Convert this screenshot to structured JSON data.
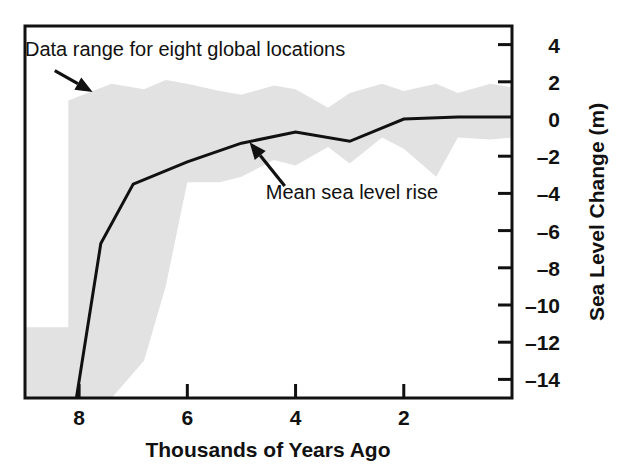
{
  "chart_data": {
    "type": "line",
    "title": "",
    "subtitle": "",
    "xlabel": "Thousands of Years Ago",
    "ylabel": "Sea Level Change (m)",
    "xlim": [
      9.0,
      0.0
    ],
    "ylim": [
      -15.0,
      5.0
    ],
    "x_inverted": true,
    "grid": false,
    "legend_position": "none",
    "xticks": [
      8,
      6,
      4,
      2
    ],
    "xtick_labels": [
      "8",
      "6",
      "4",
      "2"
    ],
    "yticks": [
      4,
      2,
      0,
      -2,
      -4,
      -6,
      -8,
      -10,
      -12,
      -14
    ],
    "ytick_labels": [
      "4",
      "2",
      "0",
      "-2",
      "-4",
      "-6",
      "-8",
      "-10",
      "-12",
      "-14"
    ],
    "series": [
      {
        "name": "Mean sea level rise",
        "type": "line",
        "color": "#111111",
        "x": [
          8.05,
          7.6,
          7.0,
          6.0,
          5.0,
          4.0,
          3.0,
          2.0,
          1.0,
          0.0
        ],
        "y": [
          -15.0,
          -6.7,
          -3.5,
          -2.3,
          -1.3,
          -0.7,
          -1.2,
          0.0,
          0.1,
          0.1
        ]
      },
      {
        "name": "Data range for eight global locations",
        "type": "band",
        "color": "#e2e2e2",
        "x": [
          9.0,
          8.2,
          8.2,
          7.4,
          6.8,
          6.4,
          6.0,
          5.4,
          5.0,
          4.4,
          4.0,
          3.4,
          3.0,
          2.4,
          2.0,
          1.4,
          1.0,
          0.4,
          0.0
        ],
        "y_upper": [
          -11.2,
          -11.2,
          1.0,
          1.9,
          1.6,
          2.1,
          1.9,
          1.5,
          1.3,
          1.8,
          1.6,
          0.6,
          1.4,
          1.9,
          1.5,
          1.9,
          1.4,
          1.9,
          1.7
        ],
        "y_lower": [
          -15.0,
          -15.0,
          -15.0,
          -15.0,
          -13.0,
          -9.0,
          -3.4,
          -3.4,
          -3.1,
          -2.2,
          -2.5,
          -1.5,
          -2.4,
          -1.0,
          -1.6,
          -3.1,
          -1.0,
          -1.1,
          -1.0
        ]
      }
    ],
    "annotations": [
      {
        "name": "data-range-annotation",
        "text": "Data range for eight global locations",
        "text_x": 9.0,
        "text_y": 3.4,
        "arrow_from": [
          8.45,
          2.6
        ],
        "arrow_to": [
          7.75,
          1.45
        ]
      },
      {
        "name": "mean-line-annotation",
        "text": "Mean sea level rise",
        "text_x": 4.55,
        "text_y": -4.3,
        "arrow_from": [
          4.2,
          -3.6
        ],
        "arrow_to": [
          4.85,
          -1.25
        ]
      }
    ]
  },
  "figure": {
    "background_color": "#ffffff",
    "frame_color": "#111111",
    "band_color": "#e2e2e2",
    "line_color": "#111111"
  }
}
